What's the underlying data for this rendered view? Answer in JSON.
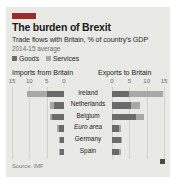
{
  "card": {
    "tag_color": "#9c2b2b",
    "background": "#e9e9e6"
  },
  "header": {
    "title": "The burden of Brexit",
    "subtitle": "Trade flows with Britain, % of country's GDP",
    "subtitle2": "2014-15 average"
  },
  "legend": {
    "items": [
      {
        "label": "Goods",
        "color": "#6b6b6b"
      },
      {
        "label": "Services",
        "color": "#a8a8a8"
      }
    ]
  },
  "footer": {
    "source": "Source: IMF"
  },
  "chart_data": {
    "type": "bar",
    "orientation": "horizontal",
    "layout": "diverging-pyramid",
    "title": "The burden of Brexit",
    "subtitle": "Trade flows with Britain, % of country's GDP",
    "note": "2014-15 average",
    "source": "Source: IMF",
    "left_axis_title": "Imports from Britain",
    "right_axis_title": "Exports to Britain",
    "left_ticks": [
      15,
      10,
      5,
      0
    ],
    "right_ticks": [
      0,
      5,
      10,
      15
    ],
    "xlim": [
      0,
      15
    ],
    "xlabel": "% of country's GDP",
    "ylabel": "",
    "grid": true,
    "legend_position": "top-left",
    "categories": [
      "Ireland",
      "Netherlands",
      "Belgium",
      "Euro area",
      "Germany",
      "Spain"
    ],
    "panels": [
      {
        "name": "Imports from Britain",
        "side": "left",
        "series": [
          {
            "name": "Goods",
            "color": "#6b6b6b",
            "values": [
              5.0,
              2.8,
              3.5,
              1.4,
              1.1,
              1.1
            ]
          },
          {
            "name": "Services",
            "color": "#a8a8a8",
            "values": [
              5.6,
              1.2,
              0.6,
              0.5,
              0.3,
              0.3
            ]
          }
        ],
        "totals": [
          10.6,
          4.0,
          4.1,
          1.9,
          1.4,
          1.4
        ]
      },
      {
        "name": "Exports to Britain",
        "side": "right",
        "series": [
          {
            "name": "Goods",
            "color": "#6b6b6b",
            "values": [
              5.0,
              5.6,
              6.9,
              2.0,
              2.5,
              2.0
            ]
          },
          {
            "name": "Services",
            "color": "#a8a8a8",
            "values": [
              9.6,
              2.5,
              2.2,
              0.6,
              0.4,
              0.5
            ]
          }
        ],
        "totals": [
          14.6,
          8.1,
          9.1,
          2.6,
          2.9,
          2.5
        ]
      }
    ]
  }
}
